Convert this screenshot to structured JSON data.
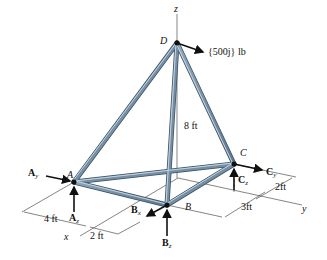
{
  "diagram": {
    "type": "space-truss",
    "points": {
      "D": {
        "label": "D"
      },
      "A": {
        "label": "A"
      },
      "B": {
        "label": "B"
      },
      "C": {
        "label": "C"
      }
    },
    "axes": {
      "x": "x",
      "y": "y",
      "z": "z"
    },
    "load": {
      "label": "{500j} lb"
    },
    "reactions": {
      "Ay": {
        "main": "A",
        "sub": "y"
      },
      "Az": {
        "main": "A",
        "sub": "z"
      },
      "Bx": {
        "main": "B",
        "sub": "x"
      },
      "Bz": {
        "main": "B",
        "sub": "z"
      },
      "Cy": {
        "main": "C",
        "sub": "y"
      },
      "Cz": {
        "main": "C",
        "sub": "z"
      }
    },
    "dimensions": {
      "height": "8 ft",
      "ax_4ft": "4 ft",
      "bx_2ft": "2 ft",
      "cy_2ft": "2ft",
      "by_3ft": "3ft"
    },
    "colors": {
      "member": "#6f8aa3",
      "member_highlight": "#b8c9d8",
      "member_edge": "#3b4f63",
      "line": "#222222"
    }
  }
}
